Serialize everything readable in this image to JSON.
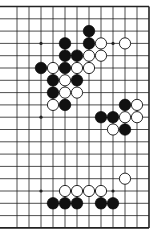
{
  "diagram": {
    "type": "go-board-fragment",
    "visible_columns": 12,
    "visible_rows": 19,
    "edges_shown": [
      "top",
      "right",
      "bottom"
    ],
    "colors": {
      "line": "#222222",
      "black_stone": "#111111",
      "white_stone": "#ffffff",
      "background": "#ffffff"
    },
    "hoshi": [
      [
        2,
        3
      ],
      [
        8,
        3
      ],
      [
        2,
        9
      ],
      [
        8,
        9
      ],
      [
        2,
        15
      ],
      [
        8,
        15
      ]
    ],
    "black_stones": [
      [
        6,
        2
      ],
      [
        6,
        3
      ],
      [
        4,
        3
      ],
      [
        4,
        4
      ],
      [
        5,
        4
      ],
      [
        2,
        5
      ],
      [
        4,
        5
      ],
      [
        3,
        6
      ],
      [
        5,
        6
      ],
      [
        3,
        7
      ],
      [
        4,
        8
      ],
      [
        9,
        8
      ],
      [
        7,
        9
      ],
      [
        8,
        9
      ],
      [
        9,
        10
      ],
      [
        3,
        16
      ],
      [
        4,
        16
      ],
      [
        5,
        16
      ],
      [
        7,
        16
      ],
      [
        8,
        16
      ]
    ],
    "white_stones": [
      [
        7,
        3
      ],
      [
        9,
        3
      ],
      [
        6,
        4
      ],
      [
        7,
        4
      ],
      [
        3,
        5
      ],
      [
        5,
        5
      ],
      [
        6,
        5
      ],
      [
        4,
        6
      ],
      [
        4,
        7
      ],
      [
        5,
        7
      ],
      [
        3,
        8
      ],
      [
        10,
        8
      ],
      [
        9,
        9
      ],
      [
        10,
        9
      ],
      [
        8,
        10
      ],
      [
        9,
        14
      ],
      [
        4,
        15
      ],
      [
        5,
        15
      ],
      [
        6,
        15
      ],
      [
        7,
        15
      ]
    ]
  }
}
